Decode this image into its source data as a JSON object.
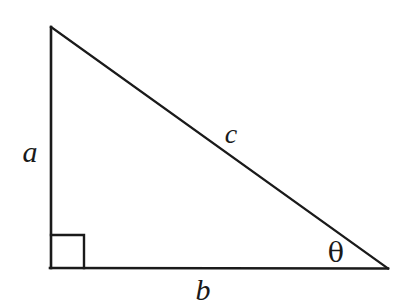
{
  "figure": {
    "background_color": "#ffffff",
    "stroke_color": "#1a1a1a",
    "stroke_width": 2.4
  },
  "labels": {
    "leg_vertical": "a",
    "leg_horizontal": "b",
    "hypotenuse": "c",
    "angle": "θ"
  },
  "geometry": {
    "apex": {
      "x": 51,
      "y": 27
    },
    "right_angle_vertex": {
      "x": 51,
      "y": 268
    },
    "angle_vertex": {
      "x": 388,
      "y": 269
    },
    "right_angle_marker_size": 33,
    "label_positions": {
      "a": {
        "x": 30,
        "y": 152
      },
      "b": {
        "x": 203,
        "y": 290
      },
      "c": {
        "x": 231,
        "y": 134
      },
      "theta": {
        "x": 336,
        "y": 252
      }
    }
  }
}
